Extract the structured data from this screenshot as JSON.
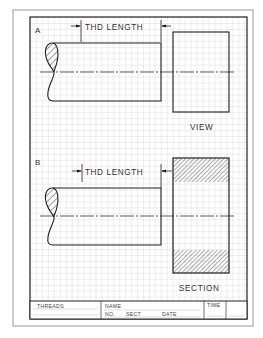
{
  "worksheet": {
    "colors": {
      "paper": "#ffffff",
      "paper_border": "#9a9a9a",
      "frame": "#222222",
      "grid": "#c8c8c8",
      "ink": "#1e1e1e",
      "text": "#333333"
    },
    "problems": [
      {
        "id": "A",
        "label": "A",
        "dimension_text": "THD LENGTH",
        "view_label": "VIEW",
        "view_type": "external"
      },
      {
        "id": "B",
        "label": "B",
        "dimension_text": "THD LENGTH",
        "view_label": "SECTION",
        "view_type": "section"
      }
    ],
    "title_block": {
      "threads": "THREADS",
      "name": "NAME",
      "no": "NO.",
      "sect": "SECT",
      "date": "DATE",
      "time": "TIME"
    }
  }
}
